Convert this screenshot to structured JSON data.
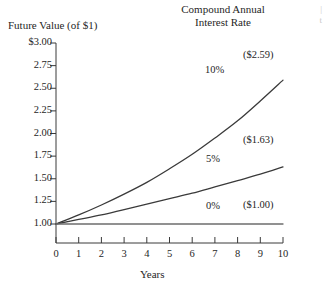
{
  "chart_data": {
    "type": "line",
    "title": "Compound Annual Interest Rate",
    "title_line1": "Compound Annual",
    "title_line2": "Interest Rate",
    "xlabel": "Years",
    "ylabel": "Future Value (of $1)",
    "xlim": [
      0,
      10
    ],
    "ylim": [
      1.0,
      3.0
    ],
    "grid": false,
    "legend": "inline-on-curve",
    "x": [
      0,
      1,
      2,
      3,
      4,
      5,
      6,
      7,
      8,
      9,
      10
    ],
    "xticklabels": [
      "0",
      "1",
      "2",
      "3",
      "4",
      "5",
      "6",
      "7",
      "8",
      "9",
      "10"
    ],
    "yticks": [
      1.0,
      1.25,
      1.5,
      1.75,
      2.0,
      2.25,
      2.5,
      2.75,
      3.0
    ],
    "yticklabels": [
      "1.00",
      "1.25",
      "1.50",
      "1.75",
      "2.00",
      "2.25",
      "2.50",
      "2.75",
      "$3.00"
    ],
    "series": [
      {
        "name": "10%",
        "rate": 0.1,
        "label": "10%",
        "end_label": "($2.59)",
        "end_value": 2.59,
        "color": "#3a3a3a",
        "values": [
          1.0,
          1.1,
          1.21,
          1.33,
          1.46,
          1.61,
          1.77,
          1.95,
          2.14,
          2.36,
          2.59
        ]
      },
      {
        "name": "5%",
        "rate": 0.05,
        "label": "5%",
        "end_label": "($1.63)",
        "end_value": 1.63,
        "color": "#3a3a3a",
        "values": [
          1.0,
          1.05,
          1.1,
          1.16,
          1.22,
          1.28,
          1.34,
          1.41,
          1.48,
          1.55,
          1.63
        ]
      },
      {
        "name": "0%",
        "rate": 0.0,
        "label": "0%",
        "end_label": "($1.00)",
        "end_value": 1.0,
        "color": "#6e6e6e",
        "values": [
          1.0,
          1.0,
          1.0,
          1.0,
          1.0,
          1.0,
          1.0,
          1.0,
          1.0,
          1.0,
          1.0
        ]
      }
    ]
  },
  "edge_bleed": {
    "line1": "|",
    "line2": "t"
  }
}
